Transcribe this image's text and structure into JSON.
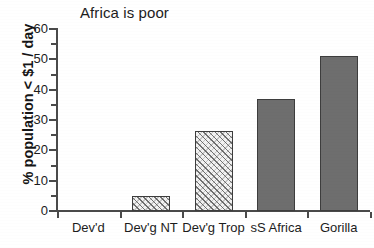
{
  "chart_data": {
    "type": "bar",
    "title": "Africa is poor",
    "xlabel": "",
    "ylabel": "% population < $1 / day",
    "categories": [
      "Dev'd",
      "Dev'g NT",
      "Dev'g Trop",
      "sS Africa",
      "Gorilla"
    ],
    "values": [
      0,
      5,
      26.5,
      37,
      51
    ],
    "ylim": [
      0,
      60
    ],
    "y_major_ticks": [
      0,
      10,
      20,
      30,
      40,
      50,
      60
    ],
    "y_minor_ticks": [
      5,
      15,
      25,
      35,
      45,
      55
    ],
    "y_tick_labels": [
      "0",
      "10",
      "20",
      "30",
      "40",
      "50",
      "60"
    ],
    "grid": false,
    "legend": false,
    "bar_styles": [
      "none",
      "hatched",
      "hatched",
      "solid",
      "solid"
    ],
    "colors": {
      "solid_fill": "#6e6e6e",
      "hatch_fill": "#f2f2f2",
      "bar_outline": "#3d3d3d",
      "axis": "#4a4a4a",
      "text": "#1c1c1c"
    }
  }
}
